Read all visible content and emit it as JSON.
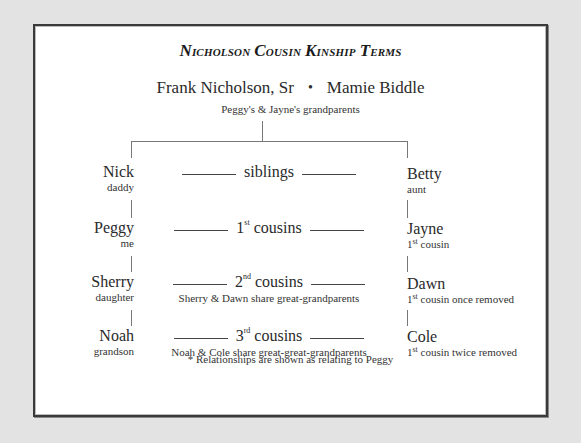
{
  "title": {
    "word1_initial": "N",
    "word1_rest": "icholson",
    "word2_initial": "C",
    "word2_rest": "ousin",
    "word3_initial": "K",
    "word3_rest": "inship",
    "word4_initial": "T",
    "word4_rest": "erms"
  },
  "grandparents": {
    "grandfather": "Frank Nicholson, Sr",
    "separator": "•",
    "grandmother": "Mamie Biddle",
    "caption": "Peggy's & Jayne's grandparents"
  },
  "left_branch": [
    {
      "name": "Nick",
      "relation": "daddy"
    },
    {
      "name": "Peggy",
      "relation": "me"
    },
    {
      "name": "Sherry",
      "relation": "daughter"
    },
    {
      "name": "Noah",
      "relation": "grandson"
    }
  ],
  "right_branch": [
    {
      "name": "Betty",
      "relation": "aunt"
    },
    {
      "name": "Jayne",
      "relation_num": "1",
      "relation_sup": "st",
      "relation_rest": " cousin"
    },
    {
      "name": "Dawn",
      "relation_num": "1",
      "relation_sup": "st",
      "relation_rest": " cousin once removed"
    },
    {
      "name": "Cole",
      "relation_num": "1",
      "relation_sup": "st",
      "relation_rest": " cousin twice removed"
    }
  ],
  "relationships": [
    {
      "label": "siblings"
    },
    {
      "num": "1",
      "sup": "st",
      "rest": " cousins"
    },
    {
      "num": "2",
      "sup": "nd",
      "rest": " cousins",
      "description": "Sherry & Dawn share great-grandparents"
    },
    {
      "num": "3",
      "sup": "rd",
      "rest": " cousins",
      "description": "Noah & Cole share great-great-grandparents"
    }
  ],
  "footnote": "* Relationships are shown as relating to Peggy"
}
